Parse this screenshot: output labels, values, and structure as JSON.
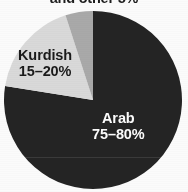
{
  "figure": {
    "title": "and other 5%",
    "background_color": "#fbfbfb"
  },
  "labels": {
    "kurdish_name": "Kurdish",
    "kurdish_value": "15–20%",
    "arab_name": "Arab",
    "arab_value": "75–80%"
  },
  "chart_data": {
    "type": "pie",
    "title": "and other 5%",
    "xlabel": "",
    "ylabel": "",
    "categories": [
      "Arab",
      "Kurdish",
      "Other"
    ],
    "values": [
      77.5,
      17.5,
      5
    ],
    "value_labels": [
      "75–80%",
      "15–20%",
      "5%"
    ],
    "colors": [
      "#242424",
      "#d9d9d9",
      "#a9a9a9"
    ],
    "label_text_colors": [
      "#fdfdfd",
      "#1a1a1a",
      "#1a1a1a"
    ],
    "series": [
      {
        "name": "Ethnic composition",
        "values": [
          77.5,
          17.5,
          5
        ]
      }
    ],
    "start_angle_deg": 0,
    "direction": "clockwise",
    "legend": "none",
    "grid": false
  },
  "geometry": {
    "center_x": 93,
    "center_y": 100,
    "radius": 89
  }
}
